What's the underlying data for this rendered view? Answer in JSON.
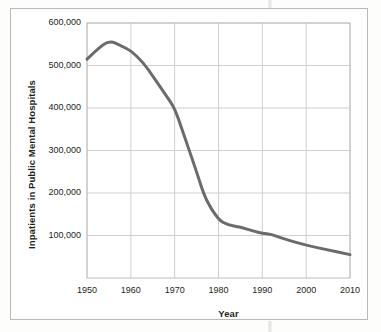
{
  "figure": {
    "background_color": "#fdfdfc",
    "border_color": "#b9b9b9",
    "plot_area": {
      "left": 86,
      "top": 22,
      "right": 349,
      "bottom": 277
    }
  },
  "chart_data": {
    "type": "line",
    "title": "",
    "xlabel": "Year",
    "ylabel": "Inpatients in Public Mental Hospitals",
    "xlim": [
      1950,
      2010
    ],
    "ylim": [
      0,
      600000
    ],
    "grid": true,
    "legend": "none",
    "line_color": "#6b6b6b",
    "line_width": 3,
    "x_tick_labels": [
      "1950",
      "1960",
      "1970",
      "1980",
      "1990",
      "2000",
      "2010"
    ],
    "x_ticks": [
      1950,
      1960,
      1970,
      1980,
      1990,
      2000,
      2010
    ],
    "y_tick_labels": [
      "600,000",
      "500,000",
      "400,000",
      "300,000",
      "200,000",
      "100,000"
    ],
    "y_ticks": [
      600000,
      500000,
      400000,
      300000,
      200000,
      100000
    ],
    "series": [
      {
        "name": "Inpatients in Public Mental Hospitals",
        "x": [
          1950,
          1952,
          1955,
          1958,
          1960,
          1963,
          1965,
          1968,
          1970,
          1972,
          1975,
          1977,
          1980,
          1982,
          1985,
          1988,
          1990,
          1992,
          1995,
          2000,
          2005,
          2010
        ],
        "values": [
          515000,
          535000,
          560000,
          545000,
          535000,
          505000,
          475000,
          430000,
          400000,
          340000,
          250000,
          185000,
          137000,
          125000,
          120000,
          110000,
          105000,
          103000,
          92000,
          77000,
          66000,
          55000
        ]
      }
    ]
  }
}
